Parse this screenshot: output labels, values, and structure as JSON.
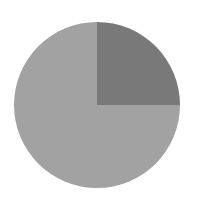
{
  "chart_data": {
    "type": "pie",
    "title": "",
    "categories": [
      "Slice A",
      "Slice B"
    ],
    "values": [
      25,
      75
    ],
    "colors": [
      "#797979",
      "#a2a2a2"
    ],
    "start_angle_deg": 0,
    "direction": "clockwise-from-top",
    "legend": "none",
    "labels_shown": false
  },
  "layout": {
    "cx": 97,
    "cy": 105,
    "r": 83
  }
}
